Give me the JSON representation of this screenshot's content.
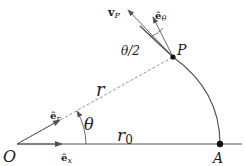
{
  "diagram": {
    "points": {
      "origin": "O",
      "end": "A",
      "particle": "P"
    },
    "labels": {
      "radius": "r",
      "initial_radius": "r",
      "initial_radius_sub": "0",
      "angle": "θ",
      "half_angle": "θ/2",
      "e_r": "ê",
      "e_r_sub": "r",
      "e_x": "ê",
      "e_x_sub": "x",
      "e_theta": "ê",
      "e_theta_sub": "θ",
      "velocity": "v",
      "velocity_sub": "P"
    },
    "colors": {
      "line": "#555555",
      "point": "#111111"
    }
  }
}
